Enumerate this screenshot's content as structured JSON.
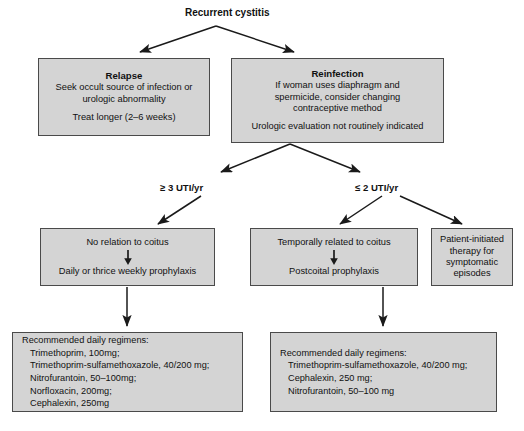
{
  "diagram": {
    "title": "Recurrent cystitis",
    "root": {
      "label": "Recurrent cystitis"
    },
    "relapse": {
      "heading": "Relapse",
      "line1": "Seek occult source of infection or",
      "line2": "urologic abnormality",
      "line3": "Treat longer (2–6 weeks)"
    },
    "reinfection": {
      "heading": "Reinfection",
      "line1": "If woman uses diaphragm and",
      "line2": "spermicide, consider changing",
      "line3": "contraceptive method",
      "line4": "Urologic evaluation not routinely indicated"
    },
    "branch_labels": {
      "high_frequency": "≥ 3 UTI/yr",
      "low_frequency": "≤ 2 UTI/yr"
    },
    "no_coitus_relation": {
      "condition": "No relation to coitus",
      "action": "Daily or thrice weekly prophylaxis"
    },
    "coitus_related": {
      "condition": "Temporally related to coitus",
      "action": "Postcoital prophylaxis"
    },
    "patient_initiated": {
      "line1": "Patient-initiated",
      "line2": "therapy for",
      "line3": "symptomatic",
      "line4": "episodes"
    },
    "regimen_left": {
      "title": "Recommended daily regimens:",
      "items": [
        "Trimethoprim, 100mg;",
        "Trimethoprim-sulfamethoxazole, 40/200 mg;",
        "Nitrofurantoin, 50–100mg;",
        "Norfloxacin, 200mg;",
        "Cephalexin, 250mg"
      ]
    },
    "regimen_right": {
      "title": "Recommended daily regimens:",
      "items": [
        "Trimethoprim-sulfamethoxazole, 40/200 mg;",
        "Cephalexin, 250 mg;",
        "Nitrofurantoin, 50–100 mg"
      ]
    },
    "colors": {
      "box_fill": "#d4d4d4",
      "box_border": "#4a4a4a",
      "connector": "#1a1a1a",
      "page_background": "#ffffff"
    }
  }
}
